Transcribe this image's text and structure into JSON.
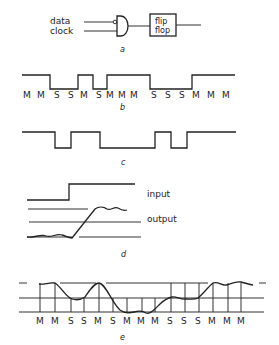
{
  "panel_a": {
    "input_labels": [
      "data",
      "clock"
    ],
    "box_label_lines": [
      "flip",
      "flop"
    ],
    "caption": "a"
  },
  "panel_b": {
    "labels": [
      "M",
      "M",
      "S",
      "S",
      "M",
      "S",
      "M",
      "M",
      "M",
      "S",
      "S",
      "S",
      "M",
      "M",
      "M"
    ],
    "caption": "b"
  },
  "panel_c": {
    "caption": "c"
  },
  "panel_d": {
    "input_label": "input",
    "output_label": "output",
    "caption": "d"
  },
  "panel_e": {
    "labels": [
      "M",
      "M",
      "S",
      "S",
      "M",
      "S",
      "M",
      "M",
      "M",
      "S",
      "S",
      "S",
      "M",
      "M",
      "M"
    ],
    "caption": "e"
  }
}
